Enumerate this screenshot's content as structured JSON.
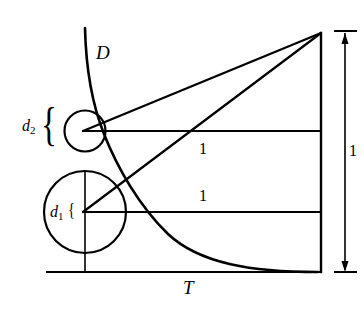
{
  "figure": {
    "type": "geometric-diagram",
    "background_color": "#ffffff",
    "stroke_color": "#000000",
    "labels": {
      "curve": "D",
      "baseline": "T",
      "small_circle_diameter": "d",
      "small_circle_diameter_sub": "2",
      "large_circle_diameter": "d",
      "large_circle_diameter_sub": "1",
      "upper_segment_length": "1",
      "lower_segment_length": "1",
      "right_dimension_length": "1"
    },
    "braces": {
      "d2_brace": "{",
      "d1_brace": "{"
    },
    "geometry": {
      "apex": {
        "x": 321,
        "y": 33
      },
      "baseline": {
        "x1": 47,
        "y1": 272,
        "x2": 321,
        "y2": 272
      },
      "right_edge": {
        "x": 321,
        "y_top": 33,
        "y_bottom": 272
      },
      "upper_horizontal": {
        "x1": 85,
        "y": 131,
        "x2": 321
      },
      "lower_horizontal": {
        "x1": 85,
        "y": 212,
        "x2": 321
      },
      "small_circle": {
        "cx": 85,
        "cy": 131,
        "r": 20.5
      },
      "large_circle": {
        "cx": 85,
        "cy": 212,
        "r": 41
      },
      "vertical_chord": {
        "x": 85,
        "y1": 171,
        "y2": 272
      },
      "dimension_line": {
        "x": 345,
        "y_top": 31,
        "y_bottom": 272
      }
    }
  }
}
